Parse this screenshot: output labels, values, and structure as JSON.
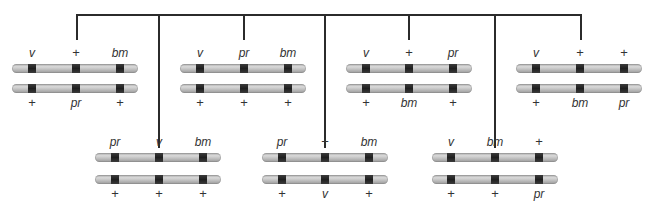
{
  "diagram": {
    "type": "gamete-chromosome-combinations",
    "loci_colors": {
      "chromosome": "#c4c4c4",
      "band": "#262626",
      "connector": "#2b2b2b"
    },
    "top_row": [
      {
        "id": "g1",
        "top": {
          "left": "v",
          "mid": "+",
          "right": "bm"
        },
        "bottom": {
          "left": "+",
          "mid": "pr",
          "right": "+"
        }
      },
      {
        "id": "g2",
        "top": {
          "left": "v",
          "mid": "pr",
          "right": "bm"
        },
        "bottom": {
          "left": "+",
          "mid": "+",
          "right": "+"
        }
      },
      {
        "id": "g3",
        "top": {
          "left": "v",
          "mid": "+",
          "right": "pr"
        },
        "bottom": {
          "left": "+",
          "mid": "bm",
          "right": "+"
        }
      },
      {
        "id": "g4",
        "top": {
          "left": "v",
          "mid": "+",
          "right": "+"
        },
        "bottom": {
          "left": "+",
          "mid": "bm",
          "right": "pr"
        }
      }
    ],
    "bottom_row": [
      {
        "id": "g5",
        "top": {
          "left": "pr",
          "mid": "v",
          "right": "bm"
        },
        "bottom": {
          "left": "+",
          "mid": "+",
          "right": "+"
        }
      },
      {
        "id": "g6",
        "top": {
          "left": "pr",
          "mid": "+",
          "right": "bm"
        },
        "bottom": {
          "left": "+",
          "mid": "v",
          "right": "+"
        }
      },
      {
        "id": "g7",
        "top": {
          "left": "v",
          "mid": "bm",
          "right": "+"
        },
        "bottom": {
          "left": "+",
          "mid": "+",
          "right": "pr"
        }
      }
    ]
  }
}
